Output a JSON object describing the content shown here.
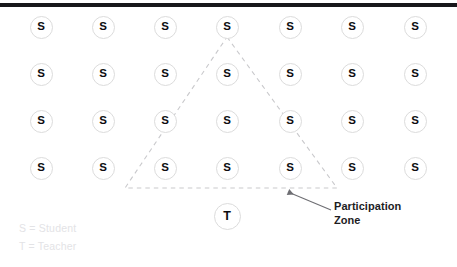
{
  "diagram": {
    "title_rule_color": "#17171a",
    "background_color": "#ffffff",
    "rows": 4,
    "columns": 7,
    "student_symbol": "S",
    "teacher_symbol": "T",
    "node_border_color": "#dcdcdc",
    "zone_line_color": "#c9c9cc"
  },
  "students": [
    {
      "label": "S",
      "x": 41,
      "y": 27
    },
    {
      "label": "S",
      "x": 103,
      "y": 27
    },
    {
      "label": "S",
      "x": 165,
      "y": 27
    },
    {
      "label": "S",
      "x": 227,
      "y": 27
    },
    {
      "label": "S",
      "x": 290,
      "y": 27
    },
    {
      "label": "S",
      "x": 352,
      "y": 27
    },
    {
      "label": "S",
      "x": 415,
      "y": 27
    },
    {
      "label": "S",
      "x": 41,
      "y": 74
    },
    {
      "label": "S",
      "x": 103,
      "y": 74
    },
    {
      "label": "S",
      "x": 165,
      "y": 74
    },
    {
      "label": "S",
      "x": 227,
      "y": 74
    },
    {
      "label": "S",
      "x": 290,
      "y": 74
    },
    {
      "label": "S",
      "x": 352,
      "y": 74
    },
    {
      "label": "S",
      "x": 415,
      "y": 74
    },
    {
      "label": "S",
      "x": 41,
      "y": 121
    },
    {
      "label": "S",
      "x": 103,
      "y": 121
    },
    {
      "label": "S",
      "x": 165,
      "y": 121
    },
    {
      "label": "S",
      "x": 227,
      "y": 121
    },
    {
      "label": "S",
      "x": 290,
      "y": 121
    },
    {
      "label": "S",
      "x": 352,
      "y": 121
    },
    {
      "label": "S",
      "x": 415,
      "y": 121
    },
    {
      "label": "S",
      "x": 41,
      "y": 168
    },
    {
      "label": "S",
      "x": 103,
      "y": 168
    },
    {
      "label": "S",
      "x": 165,
      "y": 168
    },
    {
      "label": "S",
      "x": 227,
      "y": 168
    },
    {
      "label": "S",
      "x": 290,
      "y": 168
    },
    {
      "label": "S",
      "x": 352,
      "y": 168
    },
    {
      "label": "S",
      "x": 415,
      "y": 168
    }
  ],
  "teacher": {
    "label": "T",
    "x": 227,
    "y": 216
  },
  "zone": {
    "name": "Participation Zone",
    "apex": {
      "x": 227,
      "y": 37
    },
    "base_left": {
      "x": 125,
      "y": 188
    },
    "base_right": {
      "x": 337,
      "y": 188
    },
    "annotation_line_1": "Participation",
    "annotation_line_2": "Zone"
  },
  "legend": {
    "student_entry": "S = Student",
    "teacher_entry": "T = Teacher"
  }
}
